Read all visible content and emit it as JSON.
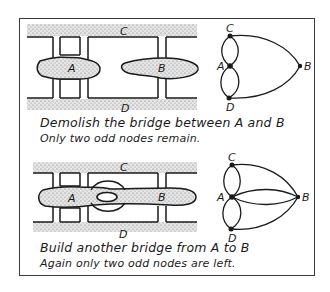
{
  "panels": [
    {
      "caption_line1": "Demolish the bridge between A and B",
      "caption_line2": "Only two odd nodes remain.",
      "map_labels": {
        "north": "C",
        "south": "D",
        "island_a": "A",
        "island_b": "B"
      },
      "graph_labels": {
        "c": "C",
        "a": "A",
        "d": "D",
        "b": "B"
      }
    },
    {
      "caption_line1": "Build another bridge from A to B",
      "caption_line2": "Again only two odd nodes are left.",
      "map_labels": {
        "north": "C",
        "south": "D",
        "island_a": "A",
        "island_b": "B"
      },
      "graph_labels": {
        "c": "C",
        "a": "A",
        "d": "D",
        "b": "B"
      }
    }
  ],
  "colors": {
    "ink": "#1a1a1a",
    "land_stipple": "#9a9a9a",
    "frame": "#3a3a3a"
  }
}
